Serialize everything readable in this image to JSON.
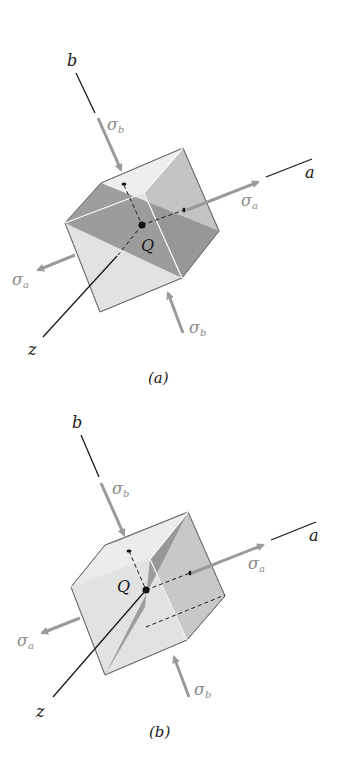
{
  "figure": {
    "panels": [
      {
        "id": "a",
        "caption": "(a)",
        "axes": {
          "b": "b",
          "a": "a",
          "z": "z"
        },
        "point": "Q",
        "stresses": {
          "top": {
            "symbol": "σ",
            "sub": "b"
          },
          "right": {
            "symbol": "σ",
            "sub": "a"
          },
          "left": {
            "symbol": "σ",
            "sub": "a"
          },
          "bottom": {
            "symbol": "σ",
            "sub": "b"
          }
        },
        "description": "Cubic element under principal stresses σa and σb with shaded diagonal plane through Q"
      },
      {
        "id": "b",
        "caption": "(b)",
        "axes": {
          "b": "b",
          "a": "a",
          "z": "z"
        },
        "point": "Q",
        "stresses": {
          "top": {
            "symbol": "σ",
            "sub": "b"
          },
          "right": {
            "symbol": "σ",
            "sub": "a"
          },
          "left": {
            "symbol": "σ",
            "sub": "a"
          },
          "bottom": {
            "symbol": "σ",
            "sub": "b"
          }
        },
        "description": "Cubic element under principal stresses σa and σb with shaded diagonal plane containing the z axis"
      }
    ],
    "colors": {
      "cube_light": "#e2e2e2",
      "cube_top": "#eeeeee",
      "cube_mid": "#c4c4c4",
      "plane_dark": "#8f8f8f",
      "arrow": "#9a9a9a",
      "axis": "#1a1a1a",
      "edge_highlight": "#ffffff"
    }
  }
}
